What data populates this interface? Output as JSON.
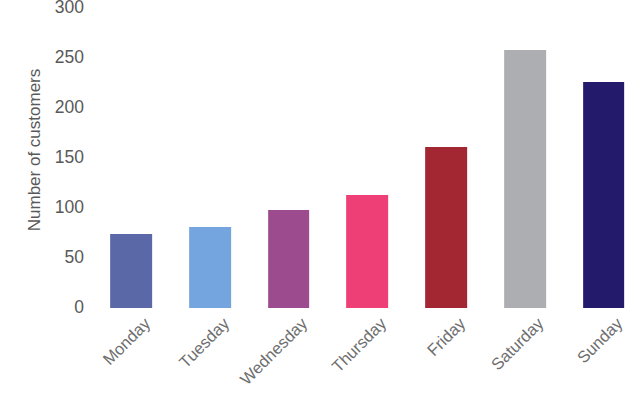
{
  "chart_data": {
    "type": "bar",
    "title": "",
    "subtitle": "",
    "xlabel": "",
    "ylabel": "Number of customers",
    "categories": [
      "Monday",
      "Tuesday",
      "Wednesday",
      "Thursday",
      "Friday",
      "Saturday",
      "Sunday"
    ],
    "values": [
      74,
      81,
      98,
      113,
      161,
      258,
      226
    ],
    "series": [
      {
        "name": "Number of customers",
        "values": [
          74,
          81,
          98,
          113,
          161,
          258,
          226
        ]
      }
    ],
    "colors": [
      "#5b68a8",
      "#74a5de",
      "#9c4c8e",
      "#ee4076",
      "#a32733",
      "#adaeb2",
      "#241a6b"
    ],
    "ylim": [
      0,
      300
    ],
    "yticks": [
      0,
      50,
      100,
      150,
      200,
      250,
      300
    ],
    "ytick_labels": [
      "0",
      "50",
      "100",
      "150",
      "200",
      "250",
      "300"
    ],
    "grid": false,
    "legend": null,
    "xtick_rotation": -45,
    "bar_width_ratio": 0.53,
    "background": "#ffffff",
    "text_color": "#595959"
  }
}
